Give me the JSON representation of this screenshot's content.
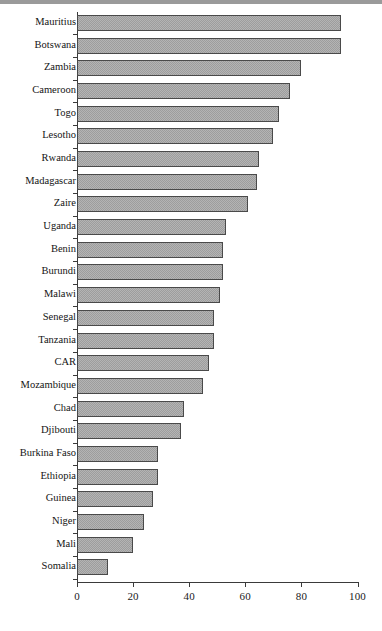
{
  "chart_data": {
    "type": "bar",
    "orientation": "horizontal",
    "title": "",
    "subtitle": "",
    "xlabel": "",
    "ylabel": "",
    "xlim": [
      0,
      100
    ],
    "xticks": [
      0,
      20,
      40,
      60,
      80,
      100
    ],
    "xtick_labels": [
      "0",
      "20",
      "40",
      "60",
      "80",
      "100"
    ],
    "grid": false,
    "legend": null,
    "categories": [
      "Mauritius",
      "Botswana",
      "Zambia",
      "Cameroon",
      "Togo",
      "Lesotho",
      "Rwanda",
      "Madagascar",
      "Zaire",
      "Uganda",
      "Benin",
      "Burundi",
      "Malawi",
      "Senegal",
      "Tanzania",
      "CAR",
      "Mozambique",
      "Chad",
      "Djibouti",
      "Burkina Faso",
      "Ethiopia",
      "Guinea",
      "Niger",
      "Mali",
      "Somalia"
    ],
    "values": [
      94,
      94,
      80,
      76,
      72,
      70,
      65,
      64,
      61,
      53,
      52,
      52,
      51,
      49,
      49,
      47,
      45,
      38,
      37,
      29,
      29,
      27,
      24,
      20,
      11
    ],
    "bar_fill_color": "#b4b4b4",
    "bar_edge_color": "#4a4a4a",
    "axis_color": "#3a3a3a"
  }
}
